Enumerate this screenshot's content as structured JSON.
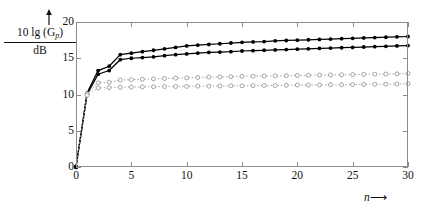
{
  "figure": {
    "y_axis_title_numerator": "10 lg (G",
    "y_axis_title_numerator_sub": "p",
    "y_axis_title_numerator_close": ")",
    "y_axis_title_denominator": "dB",
    "x_axis_name": "n",
    "x_axis_arrow": "⟶",
    "y_axis_arrow": "arrow-up-icon"
  },
  "chart_data": {
    "type": "line",
    "title": "",
    "xlabel": "n",
    "ylabel": "10 lg (G_p) / dB",
    "xlim": [
      0,
      30
    ],
    "ylim": [
      0,
      20
    ],
    "xticks": [
      0,
      5,
      10,
      15,
      20,
      25,
      30
    ],
    "yticks": [
      0,
      5,
      10,
      15,
      20
    ],
    "grid": false,
    "legend": "none",
    "x": [
      0,
      1,
      2,
      3,
      4,
      5,
      6,
      7,
      8,
      9,
      10,
      11,
      12,
      13,
      14,
      15,
      16,
      17,
      18,
      19,
      20,
      21,
      22,
      23,
      24,
      25,
      26,
      27,
      28,
      29,
      30
    ],
    "series": [
      {
        "name": "solid-upper",
        "style": "solid",
        "marker": "filled-circle",
        "color": "#000000",
        "values": [
          0,
          10.2,
          13.3,
          13.9,
          15.5,
          15.7,
          15.9,
          16.1,
          16.3,
          16.5,
          16.7,
          16.8,
          16.9,
          17.0,
          17.1,
          17.2,
          17.25,
          17.3,
          17.4,
          17.45,
          17.5,
          17.55,
          17.6,
          17.65,
          17.7,
          17.75,
          17.8,
          17.85,
          17.9,
          17.95,
          18.0
        ]
      },
      {
        "name": "solid-lower",
        "style": "solid",
        "marker": "filled-circle",
        "color": "#000000",
        "values": [
          0,
          10.0,
          12.8,
          13.3,
          14.8,
          15.0,
          15.1,
          15.2,
          15.35,
          15.5,
          15.6,
          15.7,
          15.8,
          15.85,
          15.9,
          16.0,
          16.05,
          16.1,
          16.15,
          16.2,
          16.25,
          16.3,
          16.35,
          16.4,
          16.45,
          16.5,
          16.55,
          16.6,
          16.65,
          16.7,
          16.75
        ]
      },
      {
        "name": "dotted-upper",
        "style": "dotted",
        "marker": "open-circle",
        "color": "#9a9a9a",
        "values": [
          0,
          10.1,
          11.6,
          11.7,
          12.0,
          12.05,
          12.1,
          12.15,
          12.2,
          12.25,
          12.3,
          12.35,
          12.4,
          12.42,
          12.45,
          12.5,
          12.52,
          12.55,
          12.58,
          12.6,
          12.62,
          12.65,
          12.68,
          12.7,
          12.72,
          12.75,
          12.78,
          12.8,
          12.82,
          12.85,
          12.9
        ]
      },
      {
        "name": "dotted-lower",
        "style": "dotted",
        "marker": "open-circle",
        "color": "#9a9a9a",
        "values": [
          0,
          9.9,
          10.9,
          10.95,
          11.0,
          11.02,
          11.05,
          11.07,
          11.1,
          11.1,
          11.12,
          11.15,
          11.15,
          11.18,
          11.2,
          11.2,
          11.22,
          11.25,
          11.25,
          11.28,
          11.3,
          11.3,
          11.32,
          11.35,
          11.35,
          11.38,
          11.4,
          11.4,
          11.42,
          11.45,
          11.5
        ]
      }
    ]
  }
}
